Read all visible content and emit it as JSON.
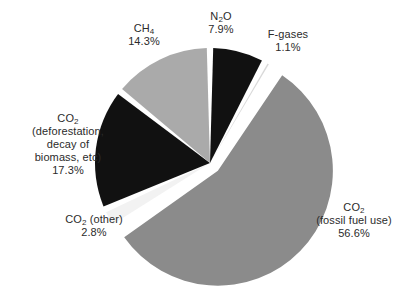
{
  "chart_data": {
    "type": "pie",
    "title": "",
    "subtitle": "",
    "xlabel": "",
    "ylabel": "",
    "legend_position": "none",
    "grid": false,
    "labels_outside": true,
    "start_angle_deg": 0,
    "direction": "clockwise",
    "categories": [
      "N2O",
      "F-gases",
      "CO2 (fossil fuel use)",
      "CO2 (other)",
      "CO2 (deforestation, decay of biomass, etc)",
      "CH4"
    ],
    "values": [
      7.9,
      1.1,
      56.6,
      2.8,
      17.3,
      14.3
    ],
    "units": "percent",
    "slices": [
      {
        "name": "N2O",
        "value": 7.9,
        "percent_text": "7.9%",
        "color": "#111111",
        "exploded": false,
        "label_lines": [
          "N2O"
        ]
      },
      {
        "name": "F-gases",
        "value": 1.1,
        "percent_text": "1.1%",
        "color": "#d9d9d9",
        "exploded": false,
        "label_lines": [
          "F-gases"
        ]
      },
      {
        "name": "CO2 fossil fuel use",
        "value": 56.6,
        "percent_text": "56.6%",
        "color": "#8b8b8b",
        "exploded": true,
        "label_lines": [
          "CO2",
          "(fossil fuel use)"
        ]
      },
      {
        "name": "CO2 other",
        "value": 2.8,
        "percent_text": "2.8%",
        "color": "#f2f2f2",
        "exploded": false,
        "label_lines": [
          "CO2 (other)"
        ]
      },
      {
        "name": "CO2 deforestation",
        "value": 17.3,
        "percent_text": "17.3%",
        "color": "#111111",
        "exploded": false,
        "label_lines": [
          "CO2",
          "(deforestation,",
          "decay of",
          "biomass, etc)"
        ]
      },
      {
        "name": "CH4",
        "value": 14.3,
        "percent_text": "14.3%",
        "color": "#aaaaaa",
        "exploded": false,
        "label_lines": [
          "CH4"
        ]
      }
    ]
  },
  "labels": {
    "n2o": {
      "name_main": "N",
      "name_sub": "2",
      "name_tail": "O",
      "percent": "7.9%"
    },
    "fgases": {
      "name": "F-gases",
      "percent": "1.1%"
    },
    "ch4": {
      "name_main": "CH",
      "name_sub": "4",
      "percent": "14.3%"
    },
    "co2_deforestation": {
      "name_main": "CO",
      "name_sub": "2",
      "line2": "(deforestation,",
      "line3": "decay of",
      "line4": "biomass, etc)",
      "percent": "17.3%"
    },
    "co2_other": {
      "name_main": "CO",
      "name_sub": "2",
      "name_tail": " (other)",
      "percent": "2.8%"
    },
    "co2_fossil": {
      "name_main": "CO",
      "name_sub": "2",
      "line2": "(fossil fuel use)",
      "percent": "56.6%"
    }
  },
  "colors": {
    "background": "#ffffff",
    "text": "#2b2b2b",
    "slice_gap": "#ffffff",
    "gray_fossil": "#8b8b8b",
    "gray_ch4": "#aaaaaa",
    "gray_fgases": "#d9d9d9",
    "gray_co2other": "#f2f2f2",
    "black": "#111111"
  }
}
